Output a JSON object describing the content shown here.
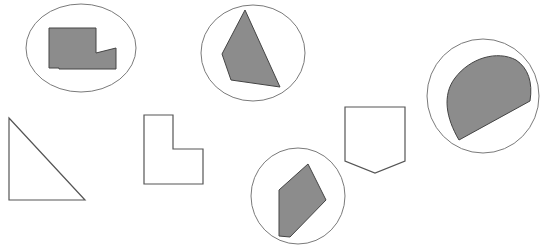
{
  "figure": {
    "width": 543,
    "height": 247,
    "background": "#ffffff",
    "colors": {
      "stroke": "#555555",
      "circle_stroke": "#7a7a7a",
      "fill": "#8c8c8c"
    },
    "circled_shapes": [
      {
        "name": "notched-rectangle",
        "circle": {
          "cx": 81,
          "cy": 48,
          "rx": 55,
          "ry": 44
        }
      },
      {
        "name": "quadrilateral",
        "circle": {
          "cx": 253,
          "cy": 53,
          "rx": 52,
          "ry": 48
        }
      },
      {
        "name": "circular-segment",
        "circle": {
          "cx": 483,
          "cy": 96,
          "rx": 56,
          "ry": 57
        }
      },
      {
        "name": "hexagon-shard",
        "circle": {
          "cx": 298,
          "cy": 196,
          "rx": 47,
          "ry": 48
        }
      }
    ],
    "outline_shapes": [
      {
        "name": "right-triangle"
      },
      {
        "name": "l-shape"
      },
      {
        "name": "pentagon-shield"
      }
    ]
  }
}
